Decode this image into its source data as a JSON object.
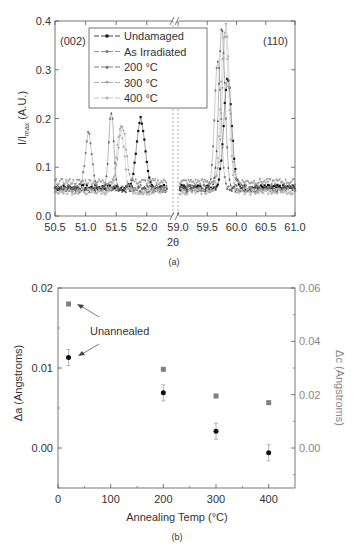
{
  "chart_data": [
    {
      "panel": "(a)",
      "type": "scatter",
      "title": "",
      "xlabel": "2θ",
      "ylabel": "I/I_max (A.U.)",
      "ylim": [
        0.0,
        0.4
      ],
      "yticks": [
        "0.0",
        "0.1",
        "0.2",
        "0.3",
        "0.4"
      ],
      "xaxis_break": {
        "left_range": [
          50.5,
          52.3
        ],
        "right_range": [
          59.0,
          61.0
        ]
      },
      "xticks_left": [
        "50.5",
        "51.0",
        "51.5",
        "52.0"
      ],
      "xticks_right": [
        "59.0",
        "59.5",
        "60.0",
        "60.5",
        "61.0"
      ],
      "annotations": [
        "(002)",
        "(110)"
      ],
      "legend_position": "upper center",
      "series": [
        {
          "name": "Undamaged",
          "marker": "square",
          "color": "#111111",
          "peaks": [
            {
              "center": 51.9,
              "height": 0.2,
              "width": 0.1
            },
            {
              "center": 59.85,
              "height": 0.285,
              "width": 0.1
            }
          ],
          "baseline": 0.058
        },
        {
          "name": "As Irradiated",
          "marker": "circle",
          "color": "#7a7a7a",
          "peaks": [
            {
              "center": 51.05,
              "height": 0.17,
              "width": 0.08
            },
            {
              "center": 59.68,
              "height": 0.32,
              "width": 0.08
            }
          ],
          "baseline": 0.058
        },
        {
          "name": "200 °C",
          "marker": "triangle-up",
          "color": "#555555",
          "peaks": [
            {
              "center": 51.42,
              "height": 0.215,
              "width": 0.06
            },
            {
              "center": 59.75,
              "height": 0.385,
              "width": 0.08
            }
          ],
          "baseline": 0.055
        },
        {
          "name": "300 °C",
          "marker": "triangle-down",
          "color": "#9a9a9a",
          "peaks": [
            {
              "center": 51.6,
              "height": 0.185,
              "width": 0.09
            },
            {
              "center": 59.82,
              "height": 0.39,
              "width": 0.09
            }
          ],
          "baseline": 0.07
        },
        {
          "name": "400 °C",
          "marker": "star",
          "color": "#b5b5b5",
          "peaks": [
            {
              "center": 51.57,
              "height": 0.18,
              "width": 0.09
            },
            {
              "center": 59.8,
              "height": 0.38,
              "width": 0.1
            }
          ],
          "baseline": 0.05
        }
      ]
    },
    {
      "panel": "(b)",
      "type": "scatter",
      "title": "",
      "xlabel": "Annealing Temp (°C)",
      "ylabel": "Δa (Angstroms)",
      "ylabel_right": "Δc (Angstroms)",
      "xlim": [
        0,
        450
      ],
      "ylim": [
        -0.005,
        0.02
      ],
      "ylim_right": [
        -0.015,
        0.06
      ],
      "xticks": [
        "0",
        "100",
        "200",
        "300",
        "400"
      ],
      "yticks": [
        "0.00",
        "0.01",
        "0.02"
      ],
      "yticks_right": [
        "0.00",
        "0.02",
        "0.04",
        "0.06"
      ],
      "annotations": [
        "Unannealed"
      ],
      "series": [
        {
          "name": "Δa",
          "axis": "left",
          "marker": "circle",
          "color": "#111111",
          "x": [
            20,
            200,
            300,
            400
          ],
          "y": [
            0.0113,
            0.0069,
            0.0021,
            -0.0006
          ],
          "yerr": [
            0.001,
            0.001,
            0.001,
            0.001
          ]
        },
        {
          "name": "Δc",
          "axis": "right",
          "marker": "square",
          "color": "#808080",
          "x": [
            20,
            200,
            300,
            400
          ],
          "y": [
            0.054,
            0.0295,
            0.0195,
            0.017
          ]
        }
      ]
    }
  ],
  "panel_a": {
    "caption": "(a)",
    "xlabel": "2θ",
    "ylabel_main": "I/I",
    "ylabel_sub": "max",
    "ylabel_tail": " (A.U.)",
    "label_002": "(002)",
    "label_110": "(110)",
    "legend": [
      "Undamaged",
      "As Irradiated",
      "200 °C",
      "300 °C",
      "400 °C"
    ]
  },
  "panel_b": {
    "caption": "(b)",
    "xlabel": "Annealing Temp (°C)",
    "ylabel_left": "Δa (Angstroms)",
    "ylabel_right": "Δc (Angstroms)",
    "annotation": "Unannealed"
  }
}
